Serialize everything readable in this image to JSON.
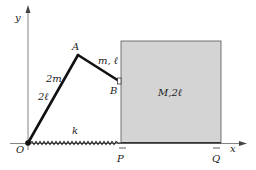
{
  "diagram": {
    "axes": {
      "y_label": "y",
      "x_label": "x",
      "origin_label": "O"
    },
    "rod_OA": {
      "mass_label": "2m",
      "length_label": "2ℓ"
    },
    "rod_AB": {
      "label": "m, ℓ"
    },
    "points": {
      "A": "A",
      "B": "B",
      "P": "P",
      "Q": "Q"
    },
    "block": {
      "label": "M,2ℓ",
      "fill": "#d4d4d4"
    },
    "spring": {
      "label": "k"
    },
    "colors": {
      "line": "#1a1a1a",
      "axis": "#555555",
      "block_fill": "#d4d4d4",
      "block_edge": "#444444"
    }
  }
}
